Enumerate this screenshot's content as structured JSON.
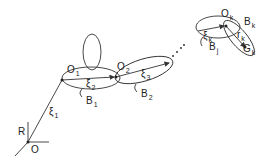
{
  "diagram": {
    "title": "",
    "labels": {
      "R": "R",
      "O": "O",
      "xi1": "ξ",
      "xi1_sub": "1",
      "O1": "O",
      "O1_sub": "1",
      "xi2": "ξ",
      "xi2_sub": "2",
      "B1": "B",
      "B1_sub": "1",
      "O2": "O",
      "O2_sub": "2",
      "xi3": "ξ",
      "xi3_sub": "3",
      "B2": "B",
      "B2_sub": "2",
      "Ok": "O",
      "Ok_sub": "k",
      "Bk": "B",
      "Bk_sub": "k",
      "xik": "ξ",
      "xik_sub": "k",
      "rk": "r",
      "rk_sub": "k",
      "Bj": "B",
      "Bj_sub": "j",
      "Gk": "G",
      "Gk_sub": "k"
    },
    "line_color": "#333333"
  }
}
